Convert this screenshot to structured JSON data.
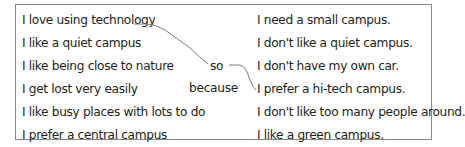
{
  "left_column": {
    "items": [
      "I love using technology",
      "I like a quiet campus",
      "I like being close to nature",
      "I get lost very easily",
      "I like busy places with lots to do",
      "I prefer a central campus"
    ]
  },
  "connectors": {
    "so": "so",
    "because": "because"
  },
  "right_column": {
    "items": [
      "I need a small campus.",
      "I don't like a quiet campus.",
      "I don't have my own car.",
      "I prefer a hi-tech campus.",
      "I don't like too many people around.",
      "I like a green campus."
    ]
  },
  "example_link": {
    "from": "I love using technology",
    "via": "so",
    "to": "I prefer a hi-tech campus."
  },
  "colors": {
    "text": "#231f20",
    "border": "#8a8a8a",
    "line": "#6d6d6d"
  }
}
